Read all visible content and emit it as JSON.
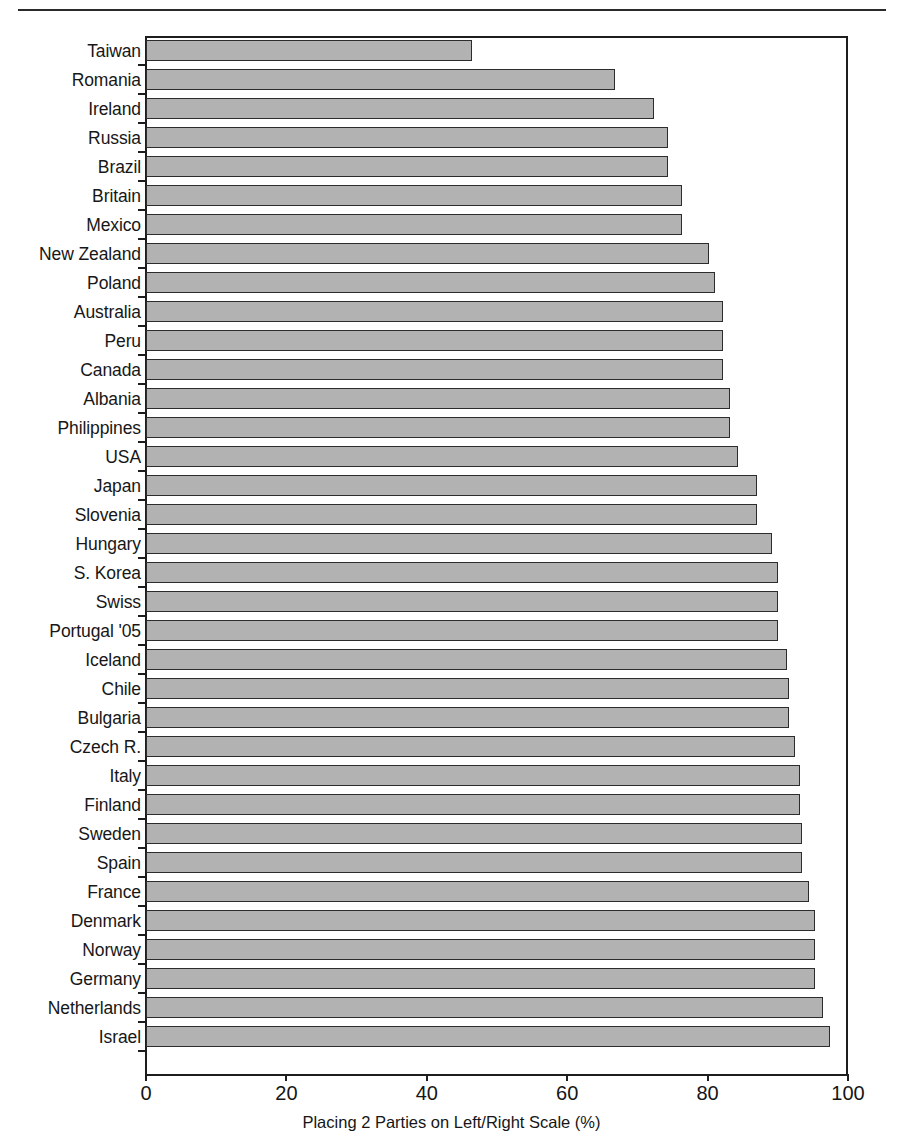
{
  "chart_data": {
    "type": "bar",
    "orientation": "horizontal",
    "title": "",
    "xlabel": "Placing 2 Parties on Left/Right Scale (%)",
    "ylabel": "",
    "xlim": [
      0,
      100
    ],
    "xticks": [
      "0",
      "20",
      "40",
      "60",
      "80",
      "100"
    ],
    "grid": false,
    "legend": false,
    "bar_fill_color": "#b2b2b2",
    "bar_border_color": "#2c2c2c",
    "categories": [
      "Taiwan",
      "Romania",
      "Ireland",
      "Russia",
      "Brazil",
      "Britain",
      "Mexico",
      "New Zealand",
      "Poland",
      "Australia",
      "Peru",
      "Canada",
      "Albania",
      "Philippines",
      "USA",
      "Japan",
      "Slovenia",
      "Hungary",
      "S. Korea",
      "Swiss",
      "Portugal '05",
      "Iceland",
      "Chile",
      "Bulgaria",
      "Czech R.",
      "Italy",
      "Finland",
      "Sweden",
      "Spain",
      "France",
      "Denmark",
      "Norway",
      "Germany",
      "Netherlands",
      "Israel"
    ],
    "values": [
      46.5,
      66.8,
      72.4,
      74.3,
      74.3,
      76.3,
      76.3,
      80.2,
      81.1,
      82.2,
      82.2,
      82.2,
      83.2,
      83.2,
      84.3,
      87.0,
      87.0,
      89.2,
      90.0,
      90.0,
      90.0,
      91.3,
      91.6,
      91.6,
      92.4,
      93.2,
      93.2,
      93.4,
      93.4,
      94.5,
      95.3,
      95.3,
      95.3,
      96.4,
      97.4
    ]
  },
  "x_axis": {
    "title": "Placing 2 Parties on Left/Right Scale (%)",
    "ticks": [
      "0",
      "20",
      "40",
      "60",
      "80",
      "100"
    ]
  }
}
